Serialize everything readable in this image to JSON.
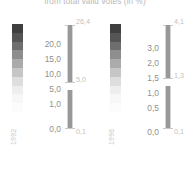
{
  "chart": {
    "title": "from total valid votes (in %)"
  },
  "chart_data": {
    "type": "bar",
    "title": "from total valid votes (in %)",
    "xlabel": "",
    "ylabel": "",
    "grid": false,
    "legend_position": "inline-left",
    "panels": [
      {
        "year": "1992",
        "axis_ticks": [
          "20,0",
          "15,0",
          "10,0",
          "5,0",
          "1,0",
          "0,0"
        ],
        "axis_values": [
          20.0,
          15.0,
          10.0,
          5.0,
          1.0,
          0.0
        ],
        "ylim": [
          0.0,
          26.4
        ],
        "legend_gradient": [
          "#3f3f3f",
          "#555555",
          "#6e6e6e",
          "#8e8e8e",
          "#ababab",
          "#c6c6c6",
          "#dedede",
          "#eeeeee",
          "#f7f7f7",
          "#fcfcfc"
        ],
        "bar_segments": [
          {
            "label": "26,4",
            "value": 26.4,
            "role": "max"
          },
          {
            "label": "5,0",
            "value": 5.0,
            "role": "mid"
          },
          {
            "label": "0,1",
            "value": 0.1,
            "role": "min"
          }
        ]
      },
      {
        "year": "1996",
        "axis_ticks": [
          "3,0",
          "2,0",
          "1,5",
          "1,0",
          "0,5",
          "0,0"
        ],
        "axis_values": [
          3.0,
          2.0,
          1.5,
          1.0,
          0.5,
          0.0
        ],
        "ylim": [
          0.0,
          4.1
        ],
        "legend_gradient": [
          "#3f3f3f",
          "#555555",
          "#6e6e6e",
          "#8e8e8e",
          "#ababab",
          "#c6c6c6",
          "#dedede",
          "#eeeeee",
          "#f7f7f7",
          "#fcfcfc"
        ],
        "bar_segments": [
          {
            "label": "4,1",
            "value": 4.1,
            "role": "max"
          },
          {
            "label": "1,3",
            "value": 1.3,
            "role": "mid"
          },
          {
            "label": "0,1",
            "value": 0.1,
            "role": "min"
          }
        ]
      }
    ],
    "colors": {
      "bar_fill": "#989898",
      "bar_track": "#cfcfcf",
      "text": "#8f8f8f",
      "value_text": "#c2c2c2",
      "title_text": "#b9b9b9"
    }
  }
}
